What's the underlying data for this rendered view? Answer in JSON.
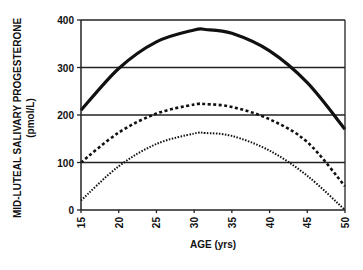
{
  "chart_data": {
    "type": "line",
    "title": "",
    "xlabel": "AGE (yrs)",
    "ylabel": "MID-LUTEAL SALIVARY PROGESTERONE",
    "ylabel_units": "(pmol/L)",
    "xlim": [
      15,
      50
    ],
    "ylim": [
      0,
      400
    ],
    "x_ticks": [
      15,
      20,
      25,
      30,
      35,
      40,
      45,
      50
    ],
    "y_ticks": [
      0,
      100,
      200,
      300,
      400
    ],
    "grid": "horizontal",
    "legend": "none",
    "x": [
      15,
      20,
      25,
      30,
      31.5,
      35,
      40,
      45,
      50
    ],
    "series": [
      {
        "name": "upper curve (solid)",
        "style": "solid",
        "values": [
          210,
          298,
          354,
          379,
          380,
          372,
          335,
          268,
          170
        ]
      },
      {
        "name": "middle curve (dashed)",
        "style": "dashed",
        "values": [
          100,
          163,
          203,
          222,
          223,
          217,
          191,
          143,
          50
        ]
      },
      {
        "name": "lower curve (dotted)",
        "style": "dotted",
        "values": [
          20,
          92,
          139,
          161,
          162,
          156,
          125,
          72,
          0
        ]
      }
    ]
  }
}
